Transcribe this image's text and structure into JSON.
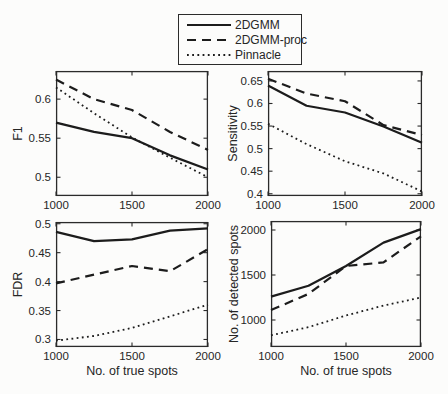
{
  "figure": {
    "background": "#fcfcfb",
    "line_color": "#1c1c1c",
    "text_color": "#262626",
    "box_color": "#2b2b2b"
  },
  "legend": {
    "position": "top-center",
    "entries": [
      {
        "label": "2DGMM",
        "style": "solid"
      },
      {
        "label": "2DGMM-proc",
        "style": "dashed"
      },
      {
        "label": "Pinnacle",
        "style": "dotted"
      }
    ]
  },
  "chart_data": [
    {
      "id": "f1",
      "type": "line",
      "title": "",
      "xlabel": "",
      "ylabel": "F1",
      "x": [
        1000,
        1250,
        1500,
        1750,
        2000
      ],
      "xlim": [
        1000,
        2000
      ],
      "ylim": [
        0.476,
        0.636
      ],
      "xticks": [
        1000,
        1500,
        2000
      ],
      "yticks": [
        0.5,
        0.55,
        0.6
      ],
      "grid": false,
      "series": [
        {
          "name": "2DGMM",
          "style": "solid",
          "values": [
            0.57,
            0.558,
            0.55,
            0.528,
            0.51
          ]
        },
        {
          "name": "2DGMM-proc",
          "style": "dashed",
          "values": [
            0.625,
            0.6,
            0.586,
            0.558,
            0.535
          ]
        },
        {
          "name": "Pinnacle",
          "style": "dotted",
          "values": [
            0.615,
            0.582,
            0.551,
            0.525,
            0.5
          ]
        }
      ],
      "layout": {
        "left": 56,
        "top": 71,
        "width": 152,
        "height": 125,
        "ylabel_offset": 34
      }
    },
    {
      "id": "sensitivity",
      "type": "line",
      "title": "",
      "xlabel": "",
      "ylabel": "Sensitivity",
      "x": [
        1000,
        1250,
        1500,
        1750,
        2000
      ],
      "xlim": [
        1000,
        2000
      ],
      "ylim": [
        0.395,
        0.672
      ],
      "xticks": [
        1000,
        1500,
        2000
      ],
      "yticks": [
        0.4,
        0.45,
        0.5,
        0.55,
        0.6,
        0.65
      ],
      "grid": false,
      "series": [
        {
          "name": "2DGMM",
          "style": "solid",
          "values": [
            0.64,
            0.595,
            0.58,
            0.549,
            0.513
          ]
        },
        {
          "name": "2DGMM-proc",
          "style": "dashed",
          "values": [
            0.655,
            0.622,
            0.605,
            0.552,
            0.53
          ]
        },
        {
          "name": "Pinnacle",
          "style": "dotted",
          "values": [
            0.555,
            0.51,
            0.472,
            0.445,
            0.405
          ]
        }
      ],
      "layout": {
        "left": 268,
        "top": 71,
        "width": 154,
        "height": 125,
        "ylabel_offset": 31
      }
    },
    {
      "id": "fdr",
      "type": "line",
      "title": "",
      "xlabel": "No. of true spots",
      "ylabel": "FDR",
      "x": [
        1000,
        1250,
        1500,
        1750,
        2000
      ],
      "xlim": [
        1000,
        2000
      ],
      "ylim": [
        0.287,
        0.503
      ],
      "xticks": [
        1000,
        1500,
        2000
      ],
      "yticks": [
        0.3,
        0.35,
        0.4,
        0.45,
        0.5
      ],
      "grid": false,
      "series": [
        {
          "name": "2DGMM",
          "style": "solid",
          "values": [
            0.486,
            0.47,
            0.473,
            0.488,
            0.492
          ]
        },
        {
          "name": "2DGMM-proc",
          "style": "dashed",
          "values": [
            0.397,
            0.412,
            0.427,
            0.418,
            0.456
          ]
        },
        {
          "name": "Pinnacle",
          "style": "dotted",
          "values": [
            0.298,
            0.306,
            0.32,
            0.34,
            0.36
          ]
        }
      ],
      "layout": {
        "left": 56,
        "top": 222,
        "width": 152,
        "height": 125,
        "ylabel_offset": 34
      }
    },
    {
      "id": "detected-spots",
      "type": "line",
      "title": "",
      "xlabel": "No. of true spots",
      "ylabel": "No. of detected spots",
      "x": [
        1000,
        1250,
        1500,
        1750,
        2000
      ],
      "xlim": [
        1000,
        2000
      ],
      "ylim": [
        700,
        2100
      ],
      "xticks": [
        1000,
        1500,
        2000
      ],
      "yticks": [
        1000,
        1500,
        2000
      ],
      "grid": false,
      "series": [
        {
          "name": "2DGMM",
          "style": "solid",
          "values": [
            1260,
            1380,
            1600,
            1860,
            2010
          ]
        },
        {
          "name": "2DGMM-proc",
          "style": "dashed",
          "values": [
            1110,
            1290,
            1600,
            1640,
            1930
          ]
        },
        {
          "name": "Pinnacle",
          "style": "dotted",
          "values": [
            830,
            920,
            1050,
            1160,
            1250
          ]
        }
      ],
      "layout": {
        "left": 271,
        "top": 221,
        "width": 150,
        "height": 126,
        "ylabel_offset": 33
      }
    }
  ]
}
